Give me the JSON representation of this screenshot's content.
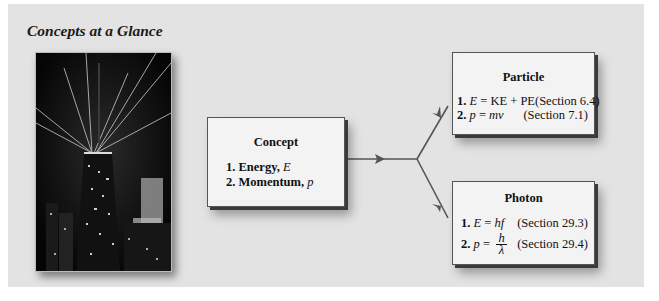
{
  "title": "Concepts at a Glance",
  "image": {
    "subject": "night-skyscraper-with-light-beams"
  },
  "concept": {
    "heading": "Concept",
    "items": [
      {
        "num": "1.",
        "label": "Energy,",
        "symbol": "E"
      },
      {
        "num": "2.",
        "label": "Momentum,",
        "symbol": "p"
      }
    ]
  },
  "particle": {
    "heading": "Particle",
    "rows": [
      {
        "num": "1.",
        "lhs": "E",
        "eq": " = KE + PE",
        "section": "(Section 6.4)"
      },
      {
        "num": "2.",
        "lhs": "p",
        "eq": " = ",
        "rhs": "mv",
        "section": "(Section 7.1)"
      }
    ]
  },
  "photon": {
    "heading": "Photon",
    "rows": [
      {
        "num": "1.",
        "lhs": "E",
        "eq": " = ",
        "rhs": "hf",
        "section": "(Section 29.3)"
      },
      {
        "num": "2.",
        "lhs": "p",
        "eq": " = ",
        "numerator": "h",
        "denominator": "λ",
        "section": "(Section 29.4)"
      }
    ]
  },
  "colors": {
    "panel": "#e3e3e3",
    "box": "#f3f3f3",
    "arrow": "#555555"
  }
}
